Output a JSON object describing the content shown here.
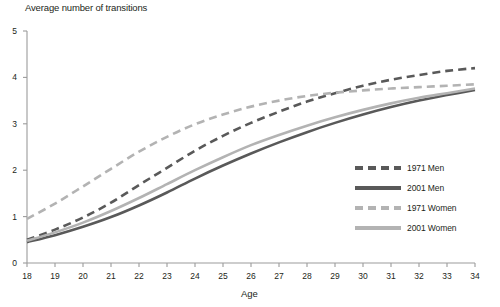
{
  "chart_data": {
    "type": "line",
    "title": "Average number of transitions",
    "xlabel": "Age",
    "ylabel": "Average number of transitions",
    "xlim": [
      18,
      34
    ],
    "ylim": [
      0,
      5
    ],
    "grid": false,
    "legend_position": "inside-right",
    "x": [
      18,
      19,
      20,
      21,
      22,
      23,
      24,
      25,
      26,
      27,
      28,
      29,
      30,
      31,
      32,
      33,
      34
    ],
    "xticks": [
      "18",
      "19",
      "20",
      "21",
      "22",
      "23",
      "24",
      "25",
      "26",
      "27",
      "28",
      "29",
      "30",
      "31",
      "32",
      "33",
      "34"
    ],
    "yticks": [
      "0",
      "1",
      "2",
      "3",
      "4",
      "5"
    ],
    "series": [
      {
        "name": "1971 Men",
        "style": "dashed",
        "color": "#595959",
        "values": [
          0.5,
          0.72,
          0.98,
          1.3,
          1.68,
          2.05,
          2.42,
          2.74,
          3.02,
          3.26,
          3.48,
          3.66,
          3.82,
          3.95,
          4.05,
          4.14,
          4.2
        ]
      },
      {
        "name": "2001 Men",
        "style": "solid",
        "color": "#595959",
        "values": [
          0.45,
          0.6,
          0.78,
          0.99,
          1.24,
          1.52,
          1.82,
          2.1,
          2.36,
          2.6,
          2.82,
          3.02,
          3.2,
          3.36,
          3.5,
          3.62,
          3.73
        ]
      },
      {
        "name": "1971 Women",
        "style": "dashed",
        "color": "#b3b3b3",
        "values": [
          0.95,
          1.28,
          1.65,
          2.03,
          2.4,
          2.72,
          2.99,
          3.2,
          3.37,
          3.5,
          3.6,
          3.67,
          3.72,
          3.76,
          3.79,
          3.82,
          3.85
        ]
      },
      {
        "name": "2001 Women",
        "style": "solid",
        "color": "#b3b3b3",
        "values": [
          0.48,
          0.66,
          0.87,
          1.12,
          1.4,
          1.7,
          2.0,
          2.28,
          2.54,
          2.76,
          2.96,
          3.14,
          3.3,
          3.44,
          3.56,
          3.66,
          3.76
        ]
      }
    ]
  },
  "legend": {
    "items": [
      {
        "label": "1971 Men",
        "swatch": "dash-dark"
      },
      {
        "label": "2001 Men",
        "swatch": "solid-dark"
      },
      {
        "label": "1971 Women",
        "swatch": "dash-light"
      },
      {
        "label": "2001 Women",
        "swatch": "solid-light"
      }
    ]
  },
  "colors": {
    "dark": "#595959",
    "light": "#b3b3b3",
    "axis": "#9b9b9b",
    "text": "#231f20",
    "background": "#ffffff"
  }
}
